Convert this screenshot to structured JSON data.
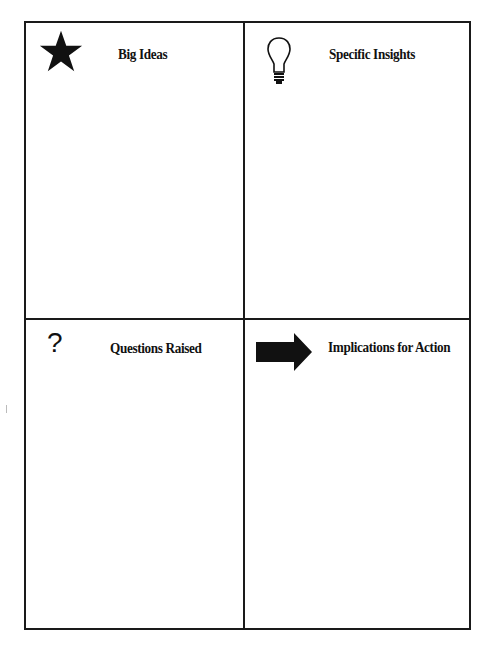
{
  "quadrants": [
    {
      "id": "big-ideas",
      "label": "Big Ideas",
      "icon": "star-icon"
    },
    {
      "id": "specific-insights",
      "label": "Specific Insights",
      "icon": "lightbulb-icon"
    },
    {
      "id": "questions-raised",
      "label": "Questions Raised",
      "icon": "question-mark-icon",
      "glyph": "?"
    },
    {
      "id": "implications-for-action",
      "label": "Implications for Action",
      "icon": "arrow-right-icon"
    }
  ],
  "colors": {
    "line": "#1a1a1a",
    "background": "#ffffff"
  }
}
